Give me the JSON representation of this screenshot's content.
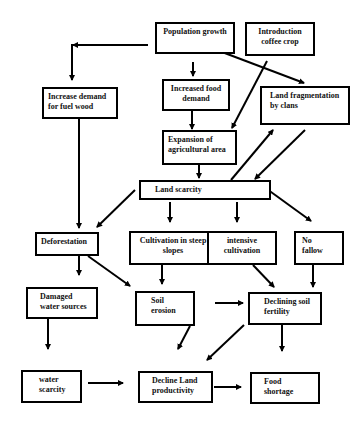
{
  "diagram": {
    "type": "flowchart",
    "nodes": {
      "population_growth": "Population growth",
      "introduction_coffee": "Introduction coffee crop",
      "fuel_wood": "Increase demand for  fuel  wood",
      "food_demand": "Increased food demand",
      "land_fragmentation": "Land fragmentation by clans",
      "expansion_agri": "Expansion   of agricultural area",
      "land_scarcity": "Land scarcity",
      "deforestation": "Deforestation",
      "steep_slopes": "Cultivation in steep slopes",
      "intensive_cultivation": "intensive cultivation",
      "no_fallow": "No fallow",
      "damaged_water": "Damaged water sources",
      "soil_erosion": "Soil erosion",
      "declining_fertility": "Declining soil fertility",
      "water_scarcity": "water scarcity",
      "decline_productivity": "Decline Land productivity",
      "food_shortage": "Food shortage"
    },
    "edges": [
      [
        "population_growth",
        "fuel_wood"
      ],
      [
        "population_growth",
        "food_demand"
      ],
      [
        "population_growth",
        "land_fragmentation"
      ],
      [
        "introduction_coffee",
        "expansion_agri"
      ],
      [
        "food_demand",
        "expansion_agri"
      ],
      [
        "expansion_agri",
        "land_scarcity"
      ],
      [
        "land_scarcity",
        "land_fragmentation"
      ],
      [
        "land_fragmentation",
        "land_scarcity"
      ],
      [
        "fuel_wood",
        "deforestation"
      ],
      [
        "land_scarcity",
        "deforestation"
      ],
      [
        "land_scarcity",
        "steep_slopes"
      ],
      [
        "land_scarcity",
        "intensive_cultivation"
      ],
      [
        "land_scarcity",
        "no_fallow"
      ],
      [
        "deforestation",
        "damaged_water"
      ],
      [
        "deforestation",
        "soil_erosion"
      ],
      [
        "steep_slopes",
        "soil_erosion"
      ],
      [
        "intensive_cultivation",
        "declining_fertility"
      ],
      [
        "no_fallow",
        "declining_fertility"
      ],
      [
        "soil_erosion",
        "declining_fertility"
      ],
      [
        "soil_erosion",
        "decline_productivity"
      ],
      [
        "declining_fertility",
        "decline_productivity"
      ],
      [
        "declining_fertility",
        "food_shortage"
      ],
      [
        "damaged_water",
        "water_scarcity"
      ],
      [
        "water_scarcity",
        "decline_productivity"
      ],
      [
        "decline_productivity",
        "food_shortage"
      ]
    ]
  }
}
